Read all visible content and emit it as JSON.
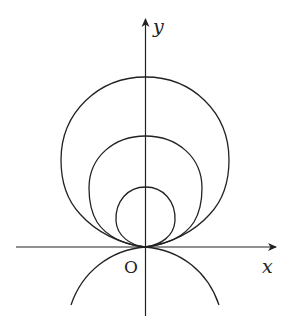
{
  "diagram": {
    "axes": {
      "x_label": "x",
      "y_label": "y",
      "origin_label": "O"
    },
    "curves": [
      {
        "name": "large-curve",
        "top_y": 77
      },
      {
        "name": "medium-curve",
        "top_y": 136
      },
      {
        "name": "small-curve",
        "top_y": 187
      },
      {
        "name": "lower-arc"
      }
    ],
    "colors": {
      "stroke": "#222222",
      "background": "#ffffff"
    }
  }
}
